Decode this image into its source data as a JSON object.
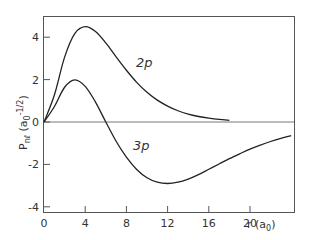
{
  "chart_data": {
    "type": "line",
    "title": "",
    "xlabel": "r (a0)",
    "ylabel": "P_nl (a0^-1/2)",
    "xlim": [
      0,
      24.3
    ],
    "ylim": [
      -4.4,
      5.0
    ],
    "x_ticks": [
      0,
      4,
      8,
      12,
      16,
      20
    ],
    "y_ticks": [
      -4,
      -2,
      0,
      2,
      4
    ],
    "grid": false,
    "legend": "none (curves labeled inline)",
    "annotations": [
      {
        "text": "2p",
        "x": 10.5,
        "y": 3.0
      },
      {
        "text": "3p",
        "x": 10.0,
        "y": -1.9
      }
    ],
    "x": [
      0,
      1,
      2,
      3,
      4,
      5,
      6,
      7,
      8,
      9,
      10,
      11,
      12,
      13,
      14,
      15,
      16,
      17,
      18,
      19,
      20,
      21,
      22,
      23,
      24
    ],
    "series": [
      {
        "name": "2p",
        "values": [
          0,
          1.26,
          3.06,
          4.18,
          4.5,
          4.27,
          3.73,
          3.07,
          2.44,
          1.87,
          1.4,
          1.03,
          0.75,
          0.53,
          0.37,
          0.26,
          0.18,
          0.12,
          0.08,
          0.05,
          0.04,
          0.03,
          0.02,
          0.01,
          0.01
        ]
      },
      {
        "name": "3p",
        "values": [
          0,
          0.72,
          1.64,
          1.99,
          1.68,
          0.94,
          0,
          -0.91,
          -1.66,
          -2.24,
          -2.63,
          -2.84,
          -2.9,
          -2.84,
          -2.69,
          -2.48,
          -2.23,
          -1.98,
          -1.73,
          -1.5,
          -1.28,
          -1.09,
          -0.92,
          -0.77,
          -0.64
        ]
      }
    ]
  },
  "labels": {
    "x_ticks": [
      "0",
      "4",
      "8",
      "12",
      "16",
      "20"
    ],
    "y_ticks": [
      "4",
      "2",
      "0",
      "-2",
      "-4"
    ],
    "xlabel_main": "r (a",
    "xlabel_sub": "0",
    "xlabel_end": ")",
    "ylabel": "P",
    "ylabel_sub": "nℓ",
    "ylabel_rest": " (a",
    "ylabel_sub2": "0",
    "ylabel_sup": "-1/2",
    "ylabel_end": ")",
    "curve_2p": "2p",
    "curve_3p": "3p"
  }
}
